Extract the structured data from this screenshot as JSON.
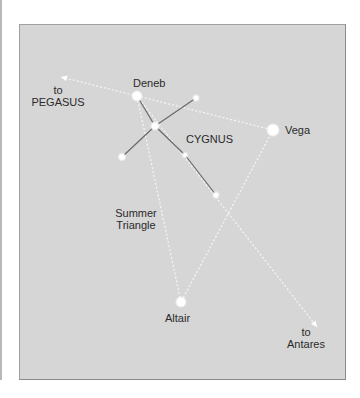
{
  "diagram": {
    "colors": {
      "background": "#d6d6d6",
      "frame_border": "#8a8a8a",
      "star": "#ffffff",
      "constellation_line": "#6a6a6a",
      "guide_line": "#f4f4f4",
      "label": "#2a2a2a"
    },
    "stars": [
      {
        "id": "deneb",
        "name": "Deneb",
        "x": 137,
        "y": 96,
        "r": 4.5
      },
      {
        "id": "vega",
        "name": "Vega",
        "x": 273,
        "y": 130,
        "r": 5.5
      },
      {
        "id": "altair",
        "name": "Altair",
        "x": 181,
        "y": 302,
        "r": 4.5
      },
      {
        "id": "sadr",
        "name": "",
        "x": 155,
        "y": 126,
        "r": 3.5
      },
      {
        "id": "wing-upper",
        "name": "",
        "x": 196,
        "y": 98,
        "r": 2.5
      },
      {
        "id": "wing-lower",
        "name": "",
        "x": 122,
        "y": 157,
        "r": 3
      },
      {
        "id": "body-mid",
        "name": "",
        "x": 185,
        "y": 155,
        "r": 2
      },
      {
        "id": "body-tail",
        "name": "",
        "x": 216,
        "y": 195,
        "r": 2.5
      }
    ],
    "labels": {
      "deneb": "Deneb",
      "vega": "Vega",
      "altair": "Altair",
      "cygnus": "CYGNUS",
      "summer_triangle_line1": "Summer",
      "summer_triangle_line2": "Triangle",
      "pegasus_line1": "to",
      "pegasus_line2": "PEGASUS",
      "antares_line1": "to",
      "antares_line2": "Antares"
    },
    "constellation_lines": [
      {
        "from": "deneb",
        "to": "sadr"
      },
      {
        "from": "sadr",
        "to": "body-mid"
      },
      {
        "from": "body-mid",
        "to": "body-tail"
      },
      {
        "from": "sadr",
        "to": "wing-upper"
      },
      {
        "from": "sadr",
        "to": "wing-lower"
      }
    ],
    "triangle_lines": [
      {
        "from": "deneb",
        "to": "vega"
      },
      {
        "from": "vega",
        "to": "altair"
      },
      {
        "from": "altair",
        "to": "deneb"
      }
    ],
    "pointer_arrows": [
      {
        "target": "PEGASUS",
        "from": [
          137,
          96
        ],
        "to": [
          61,
          77
        ]
      },
      {
        "target": "Antares",
        "from": [
          137,
          96
        ],
        "to": [
          317,
          327
        ]
      }
    ]
  }
}
